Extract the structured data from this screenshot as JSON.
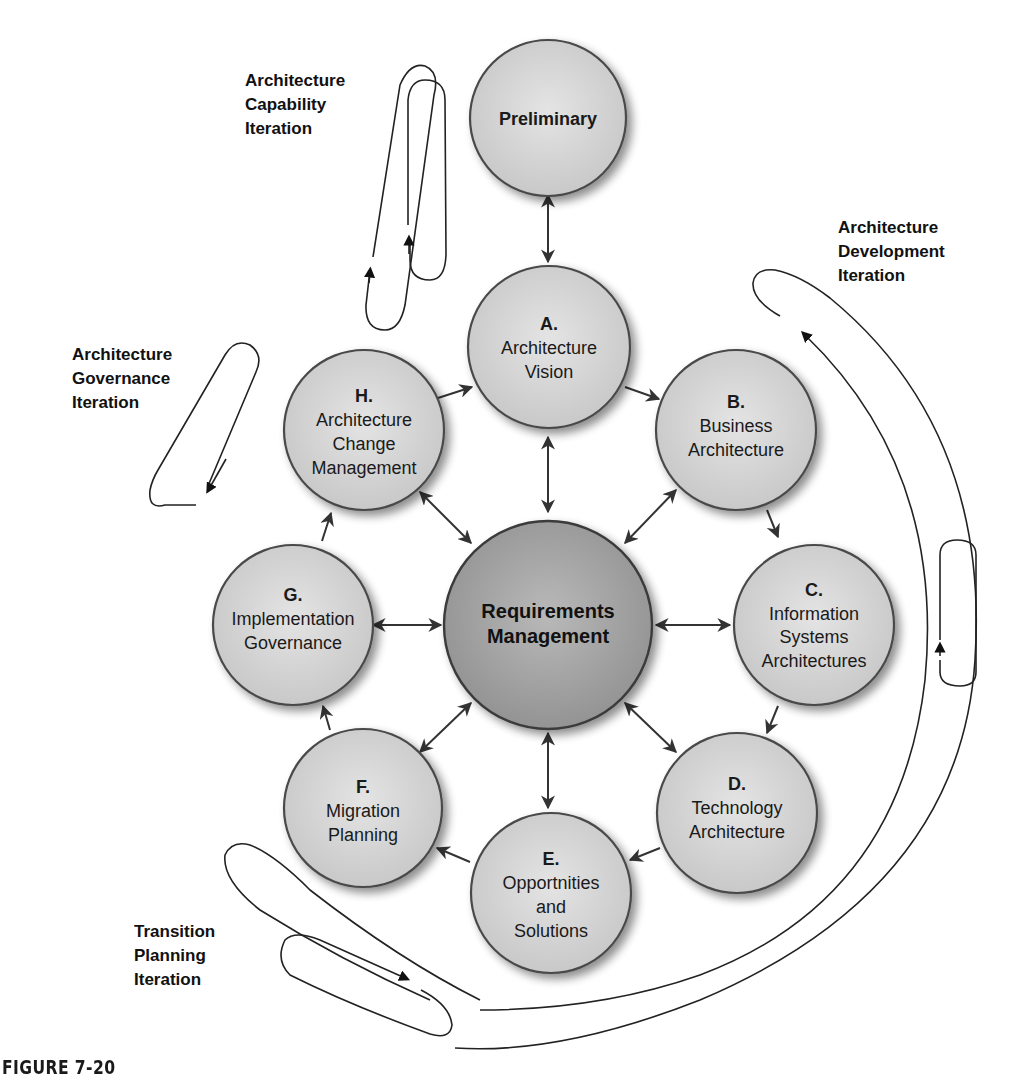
{
  "figure": {
    "caption": "FIGURE 7-20",
    "colors": {
      "phase_fill_light": "#e2e2e2",
      "phase_fill_dark": "#c4c4c4",
      "center_fill_light": "#b8b8b8",
      "center_fill_dark": "#8e8e8e",
      "stroke": "#4a4a4a",
      "text": "#1a1a1a"
    }
  },
  "preliminary": {
    "label": "Preliminary"
  },
  "center": {
    "line1": "Requirements",
    "line2": "Management"
  },
  "phases": [
    {
      "id": "A",
      "letter": "A.",
      "lines": [
        "Architecture",
        "Vision"
      ]
    },
    {
      "id": "B",
      "letter": "B.",
      "lines": [
        "Business",
        "Architecture"
      ]
    },
    {
      "id": "C",
      "letter": "C.",
      "lines": [
        "Information",
        "Systems",
        "Architectures"
      ]
    },
    {
      "id": "D",
      "letter": "D.",
      "lines": [
        "Technology",
        "Architecture"
      ]
    },
    {
      "id": "E",
      "letter": "E.",
      "lines": [
        "Opportnities",
        "and",
        "Solutions"
      ]
    },
    {
      "id": "F",
      "letter": "F.",
      "lines": [
        "Migration",
        "Planning"
      ]
    },
    {
      "id": "G",
      "letter": "G.",
      "lines": [
        "Implementation",
        "Governance"
      ]
    },
    {
      "id": "H",
      "letter": "H.",
      "lines": [
        "Architecture",
        "Change",
        "Management"
      ]
    }
  ],
  "iterations": {
    "capability": {
      "lines": [
        "Architecture",
        "Capability",
        "Iteration"
      ]
    },
    "development": {
      "lines": [
        "Architecture",
        "Development",
        "Iteration"
      ]
    },
    "governance": {
      "lines": [
        "Architecture",
        "Governance",
        "Iteration"
      ]
    },
    "transition": {
      "lines": [
        "Transition",
        "Planning",
        "Iteration"
      ]
    }
  }
}
